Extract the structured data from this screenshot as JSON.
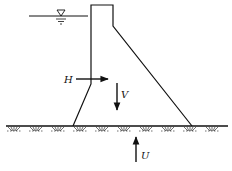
{
  "diagram": {
    "type": "gravity-dam-force-diagram",
    "forces": [
      {
        "id": "H",
        "label": "H",
        "direction": "right",
        "meaning": "horizontal water pressure"
      },
      {
        "id": "V",
        "label": "V",
        "direction": "down",
        "meaning": "self-weight"
      },
      {
        "id": "U",
        "label": "U",
        "direction": "up",
        "meaning": "uplift"
      }
    ],
    "water_level_symbol": "▽",
    "colors": {
      "line": "#111111",
      "background": "#ffffff"
    }
  }
}
